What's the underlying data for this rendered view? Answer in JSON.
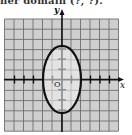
{
  "header": {
    "cropped_text": "ner domain (?, ?)."
  },
  "graph": {
    "x_label": "x",
    "y_label": "y",
    "origin_label": "O",
    "grid": {
      "left": 4.5,
      "top": 19,
      "cols": 12,
      "rows": 11,
      "cell_w": 9.5,
      "cell_h": 10.2,
      "fill": "#cfcfcf",
      "line": "#6e6e6e"
    },
    "origin_px": [
      62,
      79.5
    ],
    "ellipse": {
      "cx_units": 0,
      "cy_units": 0,
      "rx_units": 2,
      "ry_units": 3.3,
      "stroke": "#111111"
    },
    "x_ticks_units": [
      -5,
      -4,
      -3,
      -1,
      1,
      2,
      3,
      4,
      5
    ],
    "y_ticks_units": [
      -3,
      -2,
      -1,
      1,
      2,
      3
    ]
  }
}
